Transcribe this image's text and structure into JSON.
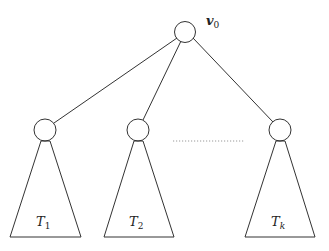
{
  "diagram": {
    "type": "tree",
    "root": {
      "label": "v",
      "subscript": "0"
    },
    "children": [
      {
        "label": "T",
        "subscript": "1"
      },
      {
        "label": "T",
        "subscript": "2"
      },
      {
        "label": "T",
        "subscript": "k"
      }
    ],
    "ellipsis": "dotted line between T2 and Tk",
    "colors": {
      "stroke": "#333333",
      "background": "#ffffff"
    }
  }
}
